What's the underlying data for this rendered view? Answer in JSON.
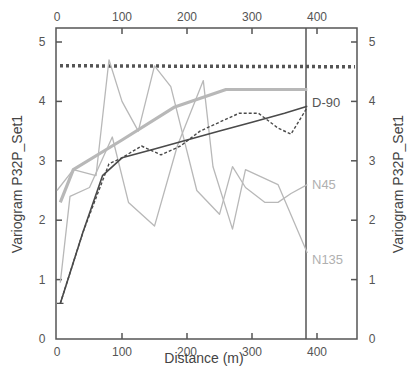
{
  "chart_data": {
    "type": "line",
    "title": "",
    "xlabel": "Distance (m)",
    "ylabel": "Variogram P32P_Set1",
    "ylabel_right": "Variogram P32P_Set1",
    "xlim": [
      0,
      460
    ],
    "ylim": [
      0,
      5.3
    ],
    "xticks": [
      0,
      100,
      200,
      300,
      400
    ],
    "yticks": [
      0,
      1,
      2,
      3,
      4,
      5
    ],
    "xtick_labels": [
      "0",
      "100",
      "200",
      "300",
      "400"
    ],
    "ytick_labels": [
      "0",
      "1",
      "2",
      "3",
      "4",
      "5"
    ],
    "top_xtick_labels": [
      "0",
      "100",
      "200",
      "300",
      "400"
    ],
    "right_ytick_labels": [
      "0",
      "1",
      "2",
      "3",
      "4",
      "5"
    ],
    "grid": false,
    "vertical_marker_x": 385,
    "sill_line": {
      "name": "sill",
      "style": "dotted",
      "value": 4.6
    },
    "series": [
      {
        "name": "D-90 (model)",
        "label": "D-90",
        "style": "solid-dark",
        "x": [
          5,
          40,
          70,
          100,
          150,
          200,
          250,
          300,
          350,
          385
        ],
        "y": [
          0.6,
          1.8,
          2.75,
          3.05,
          3.2,
          3.35,
          3.5,
          3.65,
          3.8,
          3.92
        ]
      },
      {
        "name": "D-90 (experimental)",
        "label": "",
        "style": "dashed-dark",
        "x": [
          5,
          40,
          80,
          100,
          130,
          160,
          190,
          220,
          250,
          280,
          310,
          340,
          360,
          385
        ],
        "y": [
          0.6,
          1.8,
          2.95,
          3.05,
          3.25,
          3.1,
          3.25,
          3.5,
          3.65,
          3.8,
          3.8,
          3.55,
          3.45,
          3.9
        ]
      },
      {
        "name": "N45 (model)",
        "label": "N45",
        "style": "thick-light",
        "x": [
          5,
          25,
          100,
          180,
          260,
          385
        ],
        "y": [
          2.3,
          2.85,
          3.35,
          3.9,
          4.2,
          4.2
        ]
      },
      {
        "name": "N45 (experimental)",
        "label": "",
        "style": "thin-light",
        "x": [
          0,
          25,
          60,
          80,
          100,
          125,
          150,
          175,
          215,
          250,
          270,
          290,
          320,
          340,
          360,
          385
        ],
        "y": [
          2.5,
          2.85,
          2.75,
          4.7,
          4.0,
          3.5,
          4.6,
          4.25,
          2.5,
          2.1,
          2.9,
          2.55,
          2.3,
          2.3,
          2.45,
          2.6
        ]
      },
      {
        "name": "N135 (experimental)",
        "label": "N135",
        "style": "thin-light",
        "x": [
          5,
          20,
          50,
          85,
          110,
          150,
          185,
          225,
          240,
          270,
          290,
          340,
          385
        ],
        "y": [
          0.95,
          2.4,
          2.55,
          3.4,
          2.3,
          1.9,
          3.25,
          4.35,
          2.9,
          1.85,
          2.85,
          2.6,
          1.45
        ]
      }
    ]
  },
  "labels": {
    "d90": "D-90",
    "n45": "N45",
    "n135": "N135",
    "xlabel": "Distance (m)",
    "ylabel_left": "Variogram P32P_Set1",
    "ylabel_right": "Variogram P32P_Set1",
    "bottom_ticks": [
      "0",
      "100",
      "200",
      "300",
      "400"
    ],
    "top_ticks": [
      "0",
      "100",
      "200",
      "300",
      "400"
    ],
    "left_ticks": [
      "0",
      "1",
      "2",
      "3",
      "4",
      "5"
    ],
    "right_ticks": [
      "0",
      "1",
      "2",
      "3",
      "4",
      "5"
    ]
  },
  "colors": {
    "dark": "#4a4a4a",
    "light": "#b8b8b8",
    "axis": "#555555",
    "n45_label": "#b0b0b0",
    "n135_label": "#b0b0b0",
    "d90_label": "#555555"
  }
}
